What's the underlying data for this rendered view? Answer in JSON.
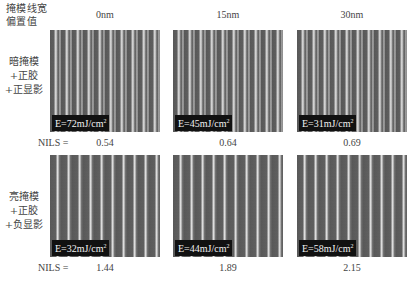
{
  "figure": {
    "corner_label_line1": "掩模线宽",
    "corner_label_line2": "偏置值",
    "columns": [
      {
        "header": "0nm"
      },
      {
        "header": "15nm"
      },
      {
        "header": "30nm"
      }
    ],
    "rows": [
      {
        "label_line1": "暗掩模",
        "label_line2": "+正胶",
        "label_line3": "+正显影",
        "doses": [
          {
            "prefix": "E=72mJ/cm",
            "exp": "2"
          },
          {
            "prefix": "E=45mJ/cm",
            "exp": "2"
          },
          {
            "prefix": "E=31mJ/cm",
            "exp": "2"
          }
        ],
        "nils_label": "NILS =",
        "nils": [
          "0.54",
          "0.64",
          "0.69"
        ]
      },
      {
        "label_line1": "亮掩模",
        "label_line2": "+正胶",
        "label_line3": "+负显影",
        "doses": [
          {
            "prefix": "E=32mJ/cm",
            "exp": "2"
          },
          {
            "prefix": "E=44mJ/cm",
            "exp": "2"
          },
          {
            "prefix": "E=58mJ/cm",
            "exp": "2"
          }
        ],
        "nils_label": "NILS =",
        "nils": [
          "1.44",
          "1.89",
          "2.15"
        ]
      }
    ]
  }
}
